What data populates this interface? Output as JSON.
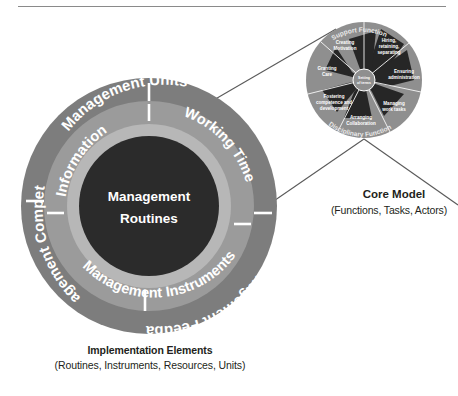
{
  "figure": {
    "title_rule": true,
    "main_model": {
      "center_label_line1": "Management",
      "center_label_line2": "Routines",
      "outer_ring_segments": [
        {
          "label": "Management Units",
          "position": "top"
        },
        {
          "label": "Management Feedback",
          "position": "bottom-right"
        },
        {
          "label": "Management Competence",
          "position": "bottom-left"
        }
      ],
      "middle_ring_segments": [
        {
          "label": "Information",
          "position": "upper-left"
        },
        {
          "label": "Working Time",
          "position": "upper-right"
        },
        {
          "label": "Management Instruments",
          "position": "bottom"
        }
      ],
      "caption_title": "Implementation Elements",
      "caption_subtitle": "(Routines, Instruments, Resources, Units)"
    },
    "core_model": {
      "center_label_line1": "Setting",
      "center_label_line2": "of terms",
      "arc_top": "Support Function",
      "arc_bottom": "Disciplinary Function",
      "tasks": [
        {
          "label_line1": "Hiring,",
          "label_line2": "retaining,",
          "label_line3": "separating"
        },
        {
          "label_line1": "Ensuring",
          "label_line2": "administration",
          "label_line3": ""
        },
        {
          "label_line1": "Managing",
          "label_line2": "work tasks",
          "label_line3": ""
        },
        {
          "label_line1": "Arranging",
          "label_line2": "Collaboration",
          "label_line3": ""
        },
        {
          "label_line1": "Fostering",
          "label_line2": "competence and",
          "label_line3": "development"
        },
        {
          "label_line1": "Granting",
          "label_line2": "Care",
          "label_line3": ""
        },
        {
          "label_line1": "Creating",
          "label_line2": "Motivation",
          "label_line3": ""
        }
      ],
      "caption_title": "Core Model",
      "caption_subtitle": "(Functions, Tasks, Actors)"
    },
    "colors": {
      "outer_ring": "#7d7d7d",
      "middle_ring": "#9b9b9b",
      "inner_highlight_ring": "#b7b7b7",
      "core_disc": "#2b2b2b",
      "core_model_disc": "#8f8f8f",
      "core_model_dark": "#262626",
      "connector_line": "#5a5a5a",
      "caption_text": "#231f20",
      "rule": "#8a8a8a"
    }
  }
}
